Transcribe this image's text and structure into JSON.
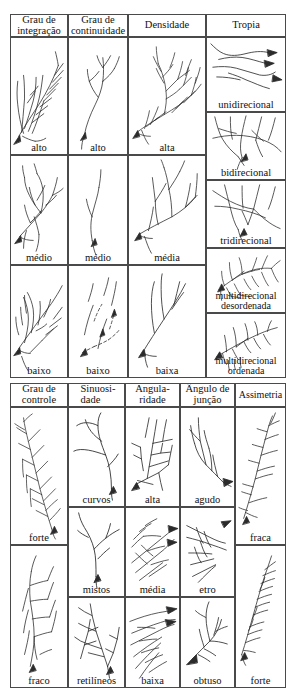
{
  "figure": {
    "kind": "classification-table",
    "line_color": "#2b2b2b",
    "border_color": "#4a4a4a",
    "background": "#ffffff"
  },
  "upper_section": {
    "headers": [
      {
        "line1": "Grau de",
        "line2": "integração"
      },
      {
        "line1": "Grau de",
        "line2": "continuidade"
      },
      {
        "line1": "Densidade",
        "line2": ""
      },
      {
        "line1": "Tropia",
        "line2": ""
      }
    ],
    "columns": [
      {
        "name": "grau-de-integracao",
        "labels": [
          "alto",
          "médio",
          "baixo"
        ]
      },
      {
        "name": "grau-de-continuidade",
        "labels": [
          "alto",
          "médio",
          "baixo"
        ]
      },
      {
        "name": "densidade",
        "labels": [
          "alta",
          "média",
          "baixa"
        ]
      },
      {
        "name": "tropia",
        "labels": [
          "unidirecional",
          "bidirecional",
          "tridirecional",
          "multidirecional desordenada",
          "multidirecional ordenada"
        ]
      }
    ],
    "tropia_labels_split": [
      {
        "line1": "unidirecional",
        "line2": ""
      },
      {
        "line1": "bidirecional",
        "line2": ""
      },
      {
        "line1": "tridirecional",
        "line2": ""
      },
      {
        "line1": "multidirecional",
        "line2": "desordenada"
      },
      {
        "line1": "multidirecional",
        "line2": "ordenada"
      }
    ]
  },
  "lower_section": {
    "headers": [
      {
        "line1": "Grau de",
        "line2": "controle"
      },
      {
        "line1": "Sinuosi-",
        "line2": "dade"
      },
      {
        "line1": "Angula-",
        "line2": "ridade"
      },
      {
        "line1": "Ângulo de",
        "line2": "junção"
      },
      {
        "line1": "Assimetria",
        "line2": ""
      }
    ],
    "columns": [
      {
        "name": "grau-de-controle",
        "labels": [
          "forte",
          "fraco"
        ]
      },
      {
        "name": "sinuosidade",
        "labels": [
          "curvos",
          "mistos",
          "retilíneos"
        ]
      },
      {
        "name": "angularidade",
        "labels": [
          "alta",
          "média",
          "baixa"
        ]
      },
      {
        "name": "angulo-de-juncao",
        "labels": [
          "agudo",
          "etro",
          "obtuso"
        ]
      },
      {
        "name": "assimetria",
        "labels": [
          "fraca",
          "forte"
        ]
      }
    ]
  }
}
